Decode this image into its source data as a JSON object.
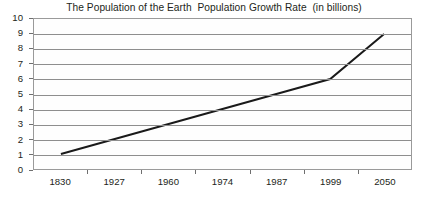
{
  "chart_data": {
    "type": "line",
    "title": "The Population of the Earth  Population Growth Rate  (in billions)",
    "xlabel": "",
    "ylabel": "",
    "categories": [
      "1830",
      "1927",
      "1960",
      "1974",
      "1987",
      "1999",
      "2050"
    ],
    "values": [
      1,
      2,
      3,
      4,
      5,
      6,
      9
    ],
    "series": [
      {
        "name": "World population (in billions)",
        "values": [
          1,
          2,
          3,
          4,
          5,
          6,
          9
        ]
      }
    ],
    "ylim": [
      0,
      10
    ],
    "y_ticks": [
      0,
      1,
      2,
      3,
      4,
      5,
      6,
      7,
      8,
      9,
      10
    ],
    "y_tick_labels": [
      "0",
      "1",
      "2",
      "3",
      "4",
      "5",
      "6",
      "7",
      "8",
      "9",
      "10"
    ],
    "x_tick_labels": [
      "1830",
      "1927",
      "1960",
      "1974",
      "1987",
      "1999",
      "2050"
    ],
    "grid": true,
    "grid_axis": "y",
    "legend": false,
    "legend_position": "none",
    "annotations": [],
    "colors": {
      "line": "#1a1a1a",
      "grid": "#8e8e8e",
      "frame": "#9a9a9a",
      "text": "#231f20",
      "background": "#ffffff",
      "plot_background": "#fefefe"
    }
  }
}
